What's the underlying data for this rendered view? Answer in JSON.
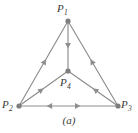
{
  "figure": {
    "caption": "(a)",
    "stroke_color": "#8d8d8d",
    "node_color": "#7d7d7d",
    "label_color": "#3a3a3a",
    "background_color": "#ffffff",
    "width": 138,
    "height": 133
  },
  "nodes": [
    {
      "id": "P1",
      "label": "P",
      "sub": "1",
      "x": 68,
      "y": 21,
      "label_x": 57,
      "label_y": 3
    },
    {
      "id": "P2",
      "label": "P",
      "sub": "2",
      "x": 19,
      "y": 106,
      "label_x": 2,
      "label_y": 99
    },
    {
      "id": "P3",
      "label": "P",
      "sub": "3",
      "x": 118,
      "y": 106,
      "label_x": 121,
      "label_y": 99
    },
    {
      "id": "P4",
      "label": "P",
      "sub": "4",
      "x": 68,
      "y": 71,
      "label_x": 60,
      "label_y": 77
    }
  ],
  "edges": [
    {
      "id": "e-p2-p1",
      "from": "P2",
      "to": "P1",
      "direction": "P2->P1",
      "arrow_at": 0.55
    },
    {
      "id": "e-p3-p1",
      "from": "P3",
      "to": "P1",
      "direction": "P3->P1",
      "arrow_at": 0.55
    },
    {
      "id": "e-p1-p4",
      "from": "P1",
      "to": "P4",
      "direction": "P1->P4",
      "arrow_at": 0.55
    },
    {
      "id": "e-p2-p4",
      "from": "P2",
      "to": "P4",
      "direction": "P2->P4",
      "arrow_at": 0.5
    },
    {
      "id": "e-p3-p4",
      "from": "P3",
      "to": "P4",
      "direction": "P3->P4",
      "arrow_at": 0.5
    },
    {
      "id": "e-p2-p3-right",
      "from": "P2",
      "to": "P3",
      "direction": "P2->P3",
      "arrow_at": 0.62
    },
    {
      "id": "e-p3-p2-left",
      "from": "P3",
      "to": "P2",
      "direction": "P3->P2",
      "arrow_at": 0.72
    }
  ],
  "chart_data": {
    "type": "diagram",
    "title": "(a)",
    "vertices": [
      "P1",
      "P2",
      "P3",
      "P4"
    ],
    "directed_edges": [
      [
        "P2",
        "P1"
      ],
      [
        "P3",
        "P1"
      ],
      [
        "P1",
        "P4"
      ],
      [
        "P2",
        "P4"
      ],
      [
        "P3",
        "P4"
      ],
      [
        "P2",
        "P3"
      ],
      [
        "P3",
        "P2"
      ]
    ]
  }
}
